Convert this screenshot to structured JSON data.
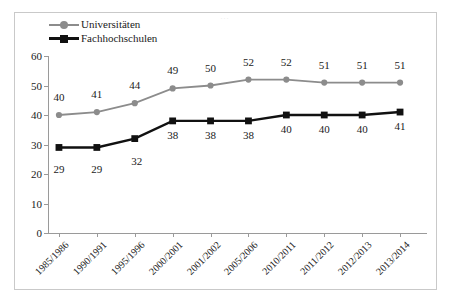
{
  "chart_data": {
    "type": "line",
    "title": "",
    "xlabel": "",
    "ylabel": "",
    "ylim": [
      0,
      60
    ],
    "yticks": [
      0,
      10,
      20,
      30,
      40,
      50,
      60
    ],
    "grid": false,
    "legend_position": "top-left",
    "categories": [
      "1985/1986",
      "1990/1991",
      "1995/1996",
      "2000/2001",
      "2001/2002",
      "2005/2006",
      "2010/2011",
      "2011/2012",
      "2012/2013",
      "2013/2014"
    ],
    "series": [
      {
        "name": "Universitäten",
        "color": "#8c8c8c",
        "marker": "circle",
        "label_position": "above",
        "values": [
          40,
          41,
          44,
          49,
          50,
          52,
          52,
          51,
          51,
          51
        ]
      },
      {
        "name": "Fachhochschulen",
        "color": "#111111",
        "marker": "square",
        "label_position": "below",
        "values": [
          29,
          29,
          32,
          38,
          38,
          38,
          40,
          40,
          40,
          41
        ]
      }
    ]
  },
  "frame": {
    "border_color": "#c9c9c9",
    "background": "#ffffff"
  }
}
